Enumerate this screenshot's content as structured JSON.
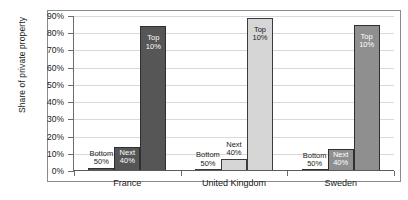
{
  "chart_data": {
    "type": "bar",
    "title": "",
    "xlabel": "",
    "ylabel": "Share of private property",
    "ylim": [
      0,
      90
    ],
    "ytick_labels": [
      "0%",
      "10%",
      "20%",
      "30%",
      "40%",
      "50%",
      "60%",
      "70%",
      "80%",
      "90%"
    ],
    "ytick_values": [
      0,
      10,
      20,
      30,
      40,
      50,
      60,
      70,
      80,
      90
    ],
    "grid": true,
    "legend": "none",
    "categories": [
      "France",
      "United Kingdom",
      "Sweden"
    ],
    "series": [
      {
        "name": "Bottom 50%",
        "label_line1": "Bottom",
        "label_line2": "50%",
        "values": [
          2,
          1,
          0
        ]
      },
      {
        "name": "Next 40%",
        "label_line1": "Next",
        "label_line2": "40%",
        "values": [
          14,
          7,
          13
        ]
      },
      {
        "name": "Top 10%",
        "label_line1": "Top",
        "label_line2": "10%",
        "values": [
          84,
          89,
          85
        ]
      }
    ],
    "group_colors": [
      "#565656",
      "#d6d6d6",
      "#8f8f8f"
    ]
  }
}
